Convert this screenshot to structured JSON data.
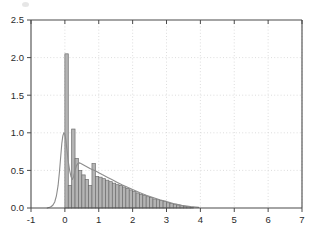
{
  "chart_data": {
    "type": "bar",
    "title": "",
    "subtitle": "",
    "xlabel": "",
    "ylabel": "",
    "xlim": [
      -1,
      7
    ],
    "ylim": [
      0.0,
      2.5
    ],
    "grid": true,
    "grid_style": "dotted",
    "legend": null,
    "legend_position": "none",
    "x_ticks": [
      -1,
      0,
      1,
      2,
      3,
      4,
      5,
      6,
      7
    ],
    "x_tick_labels": [
      "-1",
      "0",
      "1",
      "2",
      "3",
      "4",
      "5",
      "6",
      "7"
    ],
    "y_ticks": [
      0.0,
      0.5,
      1.0,
      1.5,
      2.0,
      2.5
    ],
    "y_tick_labels": [
      "0.0",
      "0.5",
      "1.0",
      "1.5",
      "2.0",
      "2.5"
    ],
    "bar_width": 0.1,
    "bar_fill_color": "#b4b4b4",
    "bar_edge_color": "#6e6e6e",
    "curve_color": "#8c8c8c",
    "axis_color": "#4a4a4a",
    "grid_color": "#cfcfcf",
    "background_color": "#ffffff",
    "series": [
      {
        "name": "histogram",
        "type": "bar",
        "bin_left_edges": [
          0.0,
          0.1,
          0.2,
          0.3,
          0.4,
          0.5,
          0.6,
          0.7,
          0.8,
          0.9,
          1.0,
          1.1,
          1.2,
          1.3,
          1.4,
          1.5,
          1.6,
          1.7,
          1.8,
          1.9,
          2.0,
          2.1,
          2.2,
          2.3,
          2.4,
          2.5,
          2.6,
          2.7,
          2.8,
          2.9,
          3.0,
          3.1,
          3.2,
          3.3,
          3.4,
          3.5,
          3.6,
          3.7
        ],
        "values": [
          2.05,
          0.3,
          1.05,
          0.66,
          0.5,
          0.44,
          0.38,
          0.3,
          0.59,
          0.42,
          0.41,
          0.39,
          0.37,
          0.35,
          0.33,
          0.31,
          0.3,
          0.28,
          0.26,
          0.24,
          0.22,
          0.2,
          0.18,
          0.17,
          0.15,
          0.14,
          0.12,
          0.11,
          0.1,
          0.09,
          0.07,
          0.06,
          0.05,
          0.04,
          0.03,
          0.02,
          0.02,
          0.01
        ]
      },
      {
        "name": "density-curve",
        "type": "line",
        "x": [
          -0.52,
          -0.45,
          -0.4,
          -0.35,
          -0.3,
          -0.25,
          -0.2,
          -0.16,
          -0.12,
          -0.09,
          -0.06,
          -0.03,
          0.0,
          0.03,
          0.06,
          0.1,
          0.14,
          0.18,
          0.22,
          0.26,
          0.3,
          0.34,
          0.38,
          0.44,
          0.5,
          0.58,
          0.66,
          0.74,
          0.82,
          0.9,
          1.0,
          1.1,
          1.25,
          1.4,
          1.55,
          1.7,
          1.85,
          2.0,
          2.2,
          2.4,
          2.6,
          2.8,
          3.0,
          3.2,
          3.45,
          3.7,
          3.95
        ],
        "y": [
          0.0,
          0.01,
          0.02,
          0.04,
          0.08,
          0.16,
          0.3,
          0.48,
          0.7,
          0.86,
          0.96,
          1.0,
          0.98,
          0.9,
          0.78,
          0.62,
          0.5,
          0.42,
          0.38,
          0.42,
          0.5,
          0.56,
          0.59,
          0.6,
          0.585,
          0.565,
          0.545,
          0.525,
          0.51,
          0.495,
          0.47,
          0.445,
          0.41,
          0.375,
          0.34,
          0.305,
          0.275,
          0.245,
          0.205,
          0.17,
          0.14,
          0.11,
          0.085,
          0.06,
          0.035,
          0.018,
          0.008
        ]
      }
    ]
  },
  "axes": {
    "plot_left_px": 31,
    "plot_right_px": 302,
    "plot_top_px": 20,
    "plot_bottom_px": 208
  }
}
